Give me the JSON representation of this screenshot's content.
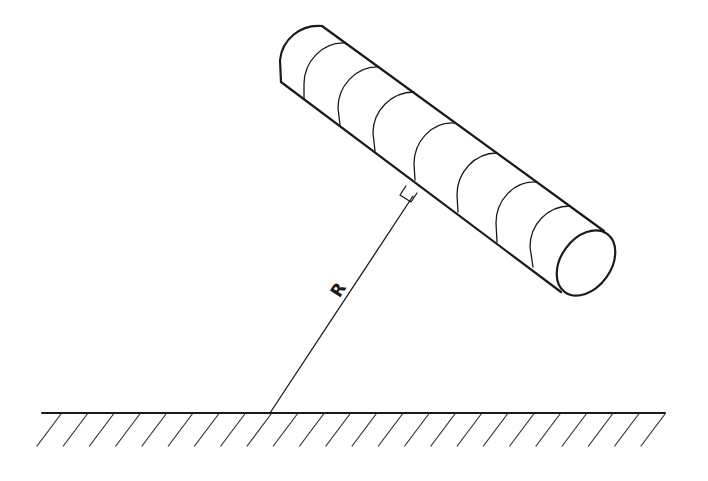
{
  "diagram": {
    "labels": {
      "distance": "R"
    },
    "colors": {
      "ink": "#1a1a1a",
      "background": "#ffffff"
    },
    "elements": {
      "cylinder": {
        "segments": 8,
        "orientation": "inclined ~36 degrees downward to the right"
      },
      "perpendicular_marker": "right-angle square",
      "ground": {
        "hatch_count": 24
      }
    }
  }
}
